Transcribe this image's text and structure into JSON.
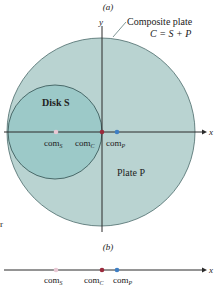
{
  "figure": {
    "part_a_label": "(a)",
    "part_b_label": "(b)",
    "composite_label_line1": "Composite plate",
    "composite_label_line2": "C = S + P",
    "disk_label": "Disk S",
    "plate_label": "Plate P",
    "axis_x": "x",
    "axis_y": "y",
    "stray_text": "r",
    "com_labels": {
      "s": {
        "base": "com",
        "sub": "S"
      },
      "c": {
        "base": "com",
        "sub": "C"
      },
      "p": {
        "base": "com",
        "sub": "P"
      }
    },
    "colors": {
      "plate_fill": "#b9d3d1",
      "disk_fill": "#9cc9c8",
      "outline": "#4a6a6a",
      "axis": "#2b2b2b",
      "com_s": "#e8c8d4",
      "com_c": "#9a2a3c",
      "com_p": "#3f7fc4"
    }
  }
}
